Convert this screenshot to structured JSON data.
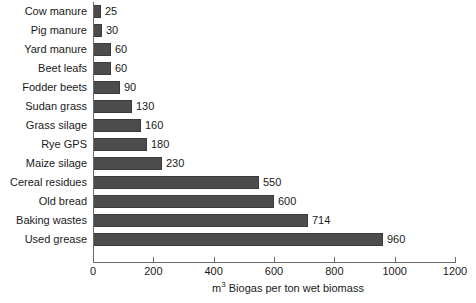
{
  "chart_data": {
    "type": "bar",
    "orientation": "horizontal",
    "title": "",
    "subtitle": "",
    "xlabel": "m3 Biogas per ton wet biomass",
    "xlabel_parts": {
      "pre": "m",
      "sup": "3",
      "post": " Biogas per ton wet biomass"
    },
    "ylabel": "",
    "categories": [
      "Cow manure",
      "Pig manure",
      "Yard manure",
      "Beet leafs",
      "Fodder beets",
      "Sudan grass",
      "Grass silage",
      "Rye GPS",
      "Maize silage",
      "Cereal residues",
      "Old bread",
      "Baking wastes",
      "Used grease"
    ],
    "values": [
      25,
      30,
      60,
      60,
      90,
      130,
      160,
      180,
      230,
      550,
      600,
      714,
      960
    ],
    "data_labels": [
      "25",
      "30",
      "60",
      "60",
      "90",
      "130",
      "160",
      "180",
      "230",
      "550",
      "600",
      "714",
      "960"
    ],
    "xlim": [
      0,
      1200
    ],
    "xticks": [
      0,
      200,
      400,
      600,
      800,
      1000,
      1200
    ],
    "xtick_labels": [
      "0",
      "200",
      "400",
      "600",
      "800",
      "1000",
      "1200"
    ],
    "grid": false,
    "legend": false,
    "legend_position": "none",
    "bar_color": "#4c4c4c",
    "bar_edge_color": "#3a3a3a",
    "axis_color": "#6b6b6b",
    "background_color": "#ffffff",
    "text_color": "#1a1a1a"
  }
}
